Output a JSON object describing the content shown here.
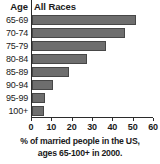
{
  "header": {
    "age_label": "Age",
    "series_label": "All Races"
  },
  "caption": {
    "line1": "% of married people in the US,",
    "line2": "ages 65-100+ in 2000."
  },
  "colors": {
    "bar_fill": "#6e6e6e",
    "bar_outline": "#474747",
    "axis": "#2b2b2b",
    "text": "#1a1a1a",
    "background": "#ffffff"
  },
  "chart_data": {
    "type": "bar",
    "orientation": "horizontal",
    "title": "",
    "subtitle": "",
    "xlabel": "% of married people in the US, ages 65-100+ in 2000.",
    "ylabel": "Age",
    "categories": [
      "65-69",
      "70-74",
      "75-79",
      "80-84",
      "85-89",
      "90-94",
      "95-99",
      "100+"
    ],
    "series": [
      {
        "name": "All Races",
        "values": [
          51,
          45.5,
          36.5,
          27,
          18,
          10.5,
          6.5,
          6
        ]
      }
    ],
    "xlim": [
      0,
      60
    ],
    "xticks": [
      0,
      10,
      20,
      30,
      40,
      50,
      60
    ],
    "xtick_labels": [
      "0",
      "10",
      "20",
      "30",
      "40",
      "50",
      "60"
    ],
    "grid": false,
    "legend": false,
    "legend_position": "none",
    "annotations": []
  }
}
